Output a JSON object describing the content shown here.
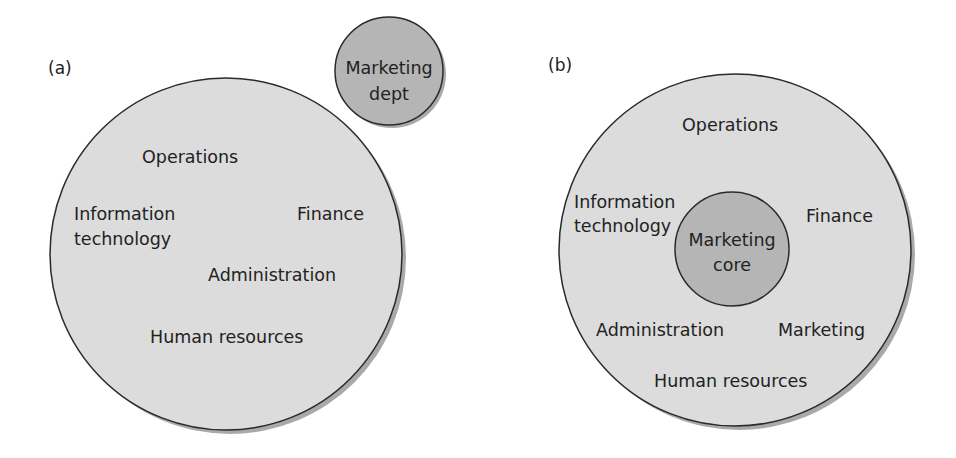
{
  "colors": {
    "background": "#ffffff",
    "outer_circle_fill": "#dcdcdc",
    "inner_circle_fill": "#b5b5b5",
    "stroke": "#2a2a2a",
    "shadow": "#8c8c8c",
    "text": "#222222"
  },
  "panel_a": {
    "tag": "(a)",
    "organisation_circle": {
      "labels": {
        "operations": "Operations",
        "it_line1": "Information",
        "it_line2": "technology",
        "finance": "Finance",
        "administration": "Administration",
        "hr": "Human resources"
      }
    },
    "marketing_circle": {
      "line1": "Marketing",
      "line2": "dept"
    }
  },
  "panel_b": {
    "tag": "(b)",
    "organisation_circle": {
      "labels": {
        "operations": "Operations",
        "it_line1": "Information",
        "it_line2": "technology",
        "finance": "Finance",
        "administration": "Administration",
        "marketing": "Marketing",
        "hr": "Human resources"
      }
    },
    "marketing_core": {
      "line1": "Marketing",
      "line2": "core"
    }
  }
}
